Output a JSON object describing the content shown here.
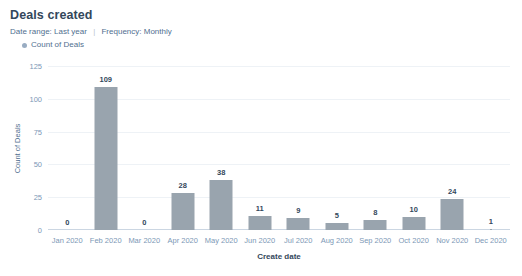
{
  "header": {
    "title": "Deals created",
    "date_range_label": "Date range: Last year",
    "separator": "|",
    "frequency_label": "Frequency: Monthly",
    "legend_label": "Count of Deals",
    "legend_color": "#99acc2"
  },
  "axis": {
    "y_title": "Count of Deals",
    "x_title": "Create date",
    "y_ticks": [
      "0",
      "25",
      "50",
      "75",
      "100",
      "125"
    ]
  },
  "chart_data": {
    "type": "bar",
    "title": "Deals created",
    "subtitle": "Date range: Last year | Frequency: Monthly",
    "xlabel": "Create date",
    "ylabel": "Count of Deals",
    "ylim": [
      0,
      125
    ],
    "yticks": [
      0,
      25,
      50,
      75,
      100,
      125
    ],
    "grid": true,
    "legend": [
      "Count of Deals"
    ],
    "legend_position": "top-left",
    "bar_color": "#99a4ae",
    "categories": [
      "Jan 2020",
      "Feb 2020",
      "Mar 2020",
      "Apr 2020",
      "May 2020",
      "Jun 2020",
      "Jul 2020",
      "Aug 2020",
      "Sep 2020",
      "Oct 2020",
      "Nov 2020",
      "Dec 2020"
    ],
    "values": [
      0,
      109,
      0,
      28,
      38,
      11,
      9,
      5,
      8,
      10,
      24,
      1
    ],
    "data_labels": [
      "0",
      "109",
      "0",
      "28",
      "38",
      "11",
      "9",
      "5",
      "8",
      "10",
      "24",
      "1"
    ]
  }
}
